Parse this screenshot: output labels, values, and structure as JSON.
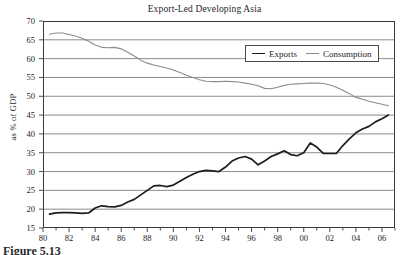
{
  "chart_data": {
    "type": "line",
    "title": "Export-Led Developing Asia",
    "xlabel": "",
    "ylabel": "as % of GDP",
    "xlim": [
      1980,
      2007
    ],
    "ylim": [
      15,
      70
    ],
    "ytick_step": 5,
    "grid": "horizontal",
    "legend_position": "top-right",
    "x_tick_labels": [
      "80",
      "82",
      "84",
      "86",
      "88",
      "90",
      "92",
      "94",
      "96",
      "98",
      "00",
      "02",
      "04",
      "06"
    ],
    "x_tick_values": [
      1980,
      1982,
      1984,
      1986,
      1988,
      1990,
      1992,
      1994,
      1996,
      1998,
      2000,
      2002,
      2004,
      2006
    ],
    "y_tick_labels": [
      "70",
      "65",
      "60",
      "55",
      "50",
      "45",
      "40",
      "35",
      "30",
      "25",
      "20",
      "15"
    ],
    "y_tick_values": [
      70,
      65,
      60,
      55,
      50,
      45,
      40,
      35,
      30,
      25,
      20,
      15
    ],
    "x": [
      1980.5,
      1981,
      1981.5,
      1982,
      1982.5,
      1983,
      1983.5,
      1984,
      1984.5,
      1985,
      1985.5,
      1986,
      1986.5,
      1987,
      1987.5,
      1988,
      1988.5,
      1989,
      1989.5,
      1990,
      1990.5,
      1991,
      1991.5,
      1992,
      1992.5,
      1993,
      1993.5,
      1994,
      1994.5,
      1995,
      1995.5,
      1996,
      1996.5,
      1997,
      1997.5,
      1998,
      1998.5,
      1999,
      1999.5,
      2000,
      2000.5,
      2001,
      2001.5,
      2002,
      2002.5,
      2003,
      2003.5,
      2004,
      2004.5,
      2005,
      2005.5,
      2006,
      2006.5
    ],
    "series": [
      {
        "name": "Exports",
        "color": "#1c1c1c",
        "values": [
          18.7,
          19.0,
          19.1,
          19.1,
          19.0,
          18.9,
          19.0,
          20.3,
          20.9,
          20.7,
          20.6,
          21.0,
          21.9,
          22.6,
          23.8,
          25.0,
          26.2,
          26.3,
          26.0,
          26.4,
          27.4,
          28.4,
          29.3,
          30.0,
          30.3,
          30.2,
          30.0,
          31.2,
          32.8,
          33.6,
          34.0,
          33.3,
          31.8,
          32.8,
          34.0,
          34.7,
          35.5,
          34.5,
          34.2,
          35.0,
          37.6,
          36.5,
          34.8,
          34.8,
          34.8,
          36.9,
          38.7,
          40.3,
          41.3,
          42.0,
          43.2,
          44.0,
          45.0
        ]
      },
      {
        "name": "Consumption",
        "color": "#8c8c8c",
        "values": [
          66.5,
          66.8,
          66.8,
          66.4,
          66.0,
          65.4,
          64.6,
          63.6,
          63.0,
          62.9,
          63.0,
          62.6,
          61.7,
          60.7,
          59.6,
          58.8,
          58.3,
          57.9,
          57.5,
          57.0,
          56.3,
          55.6,
          55.0,
          54.4,
          54.0,
          53.9,
          53.9,
          54.0,
          53.9,
          53.8,
          53.5,
          53.2,
          52.8,
          52.1,
          52.0,
          52.4,
          52.9,
          53.2,
          53.3,
          53.4,
          53.5,
          53.5,
          53.4,
          53.0,
          52.4,
          51.6,
          50.7,
          49.7,
          49.2,
          48.7,
          48.3,
          47.9,
          47.5
        ]
      }
    ]
  },
  "legend": {
    "items": [
      {
        "label": "Exports",
        "key": "exports"
      },
      {
        "label": "Consumption",
        "key": "consumption"
      }
    ]
  },
  "caption": {
    "text": "Figure 5.13"
  }
}
